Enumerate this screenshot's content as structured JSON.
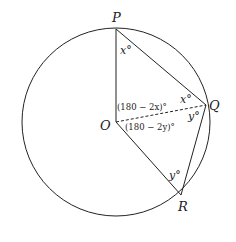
{
  "diagram": {
    "type": "circle-geometry",
    "stroke_color": "#222222",
    "circle": {
      "center": "O",
      "cx": 116,
      "cy": 122,
      "r": 94
    },
    "points": {
      "P": {
        "label": "P",
        "x": 116,
        "y": 29
      },
      "O": {
        "label": "O",
        "x": 116,
        "y": 122
      },
      "Q": {
        "label": "Q",
        "x": 206,
        "y": 105
      },
      "R": {
        "label": "R",
        "x": 181,
        "y": 195
      }
    },
    "segments": [
      {
        "from": "P",
        "to": "O",
        "style": "solid"
      },
      {
        "from": "P",
        "to": "Q",
        "style": "solid"
      },
      {
        "from": "O",
        "to": "R",
        "style": "solid"
      },
      {
        "from": "Q",
        "to": "R",
        "style": "solid"
      },
      {
        "from": "O",
        "to": "Q",
        "style": "dashed"
      }
    ],
    "angle_labels": {
      "at_P": "x°",
      "at_Q_upper": "x°",
      "at_Q_lower": "y°",
      "at_R": "y°",
      "at_O_upper": "(180 − 2x)°",
      "at_O_lower": "(180 − 2y)°"
    }
  }
}
